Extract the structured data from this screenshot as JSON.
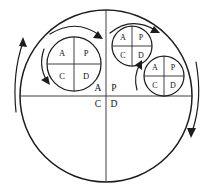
{
  "figure": {
    "background_color": "#ffffff",
    "line_color": "#1c1c1c",
    "text_color": "#111111"
  },
  "quadrant_labels": {
    "plan": "P",
    "do": "D",
    "check": "C",
    "act": "A"
  },
  "circles": [
    {
      "id": "outer-circle",
      "role": "master-cycle",
      "cx": 106,
      "cy": 96,
      "r": 86,
      "labels": {
        "top_left": "A",
        "top_right": "P",
        "bottom_left": "C",
        "bottom_right": "D"
      },
      "label_size": "label-big"
    },
    {
      "id": "inner-circle-left",
      "role": "sub-cycle",
      "cx": 74,
      "cy": 64,
      "r": 27,
      "labels": {
        "top_left": "A",
        "top_right": "P",
        "bottom_left": "C",
        "bottom_right": "D"
      },
      "label_size": "label-mid"
    },
    {
      "id": "inner-circle-top",
      "role": "sub-cycle",
      "cx": 132,
      "cy": 46,
      "r": 20,
      "labels": {
        "top_left": "A",
        "top_right": "P",
        "bottom_left": "C",
        "bottom_right": "D"
      },
      "label_size": "label-sm"
    },
    {
      "id": "inner-circle-right",
      "role": "sub-cycle",
      "cx": 164,
      "cy": 76,
      "r": 20,
      "labels": {
        "top_left": "A",
        "top_right": "P",
        "bottom_left": "C",
        "bottom_right": "D"
      },
      "label_size": "label-sm"
    }
  ],
  "arrows": [
    {
      "id": "arrow-outer-left",
      "direction": "up",
      "description": "counter-clockwise arc arrow on outer left"
    },
    {
      "id": "arrow-outer-right",
      "direction": "down",
      "description": "clockwise arc arrow on outer right"
    },
    {
      "id": "arrow-left-circle-outside",
      "direction": "clockwise",
      "description": "arc arrow over left sub-cycle"
    },
    {
      "id": "arrow-left-circle-inside",
      "direction": "down",
      "description": "arc arrow left of left sub-cycle"
    },
    {
      "id": "arrow-top-circle",
      "direction": "clockwise",
      "description": "arc arrow over top sub-cycle"
    },
    {
      "id": "arrow-right-circle",
      "direction": "up",
      "description": "arc arrow left of right sub-cycle"
    }
  ]
}
